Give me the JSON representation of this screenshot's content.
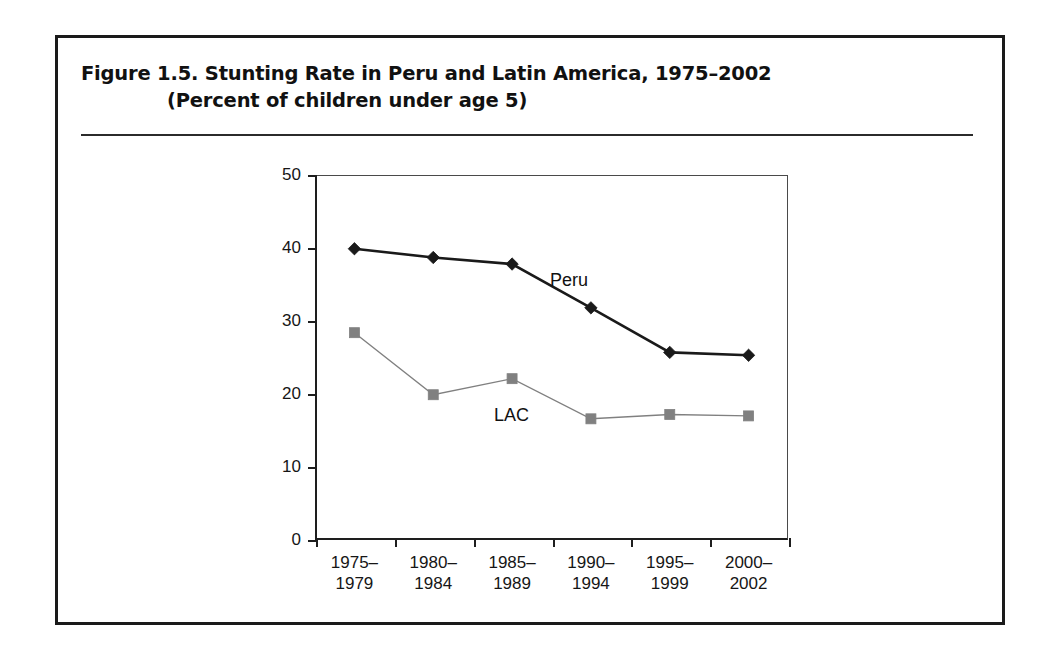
{
  "figure": {
    "title_line_1": "Figure 1.5.  Stunting Rate in Peru and Latin America, 1975–2002",
    "title_line_2": "(Percent of children under age 5)"
  },
  "chart_data": {
    "type": "line",
    "title": "Figure 1.5.  Stunting Rate in Peru and Latin America, 1975–2002",
    "subtitle": "(Percent of children under age 5)",
    "xlabel": "",
    "ylabel": "",
    "ylim": [
      0,
      50
    ],
    "yticks": [
      0,
      10,
      20,
      30,
      40,
      50
    ],
    "ytick_labels": [
      "0",
      "10",
      "20",
      "30",
      "40",
      "50"
    ],
    "grid": false,
    "legend": "inline-annotations",
    "categories": [
      "1975–\n1979",
      "1980–\n1984",
      "1985–\n1989",
      "1990–\n1994",
      "1995–\n1999",
      "2000–\n2002"
    ],
    "category_lines": [
      [
        "1975–",
        "1979"
      ],
      [
        "1980–",
        "1984"
      ],
      [
        "1985–",
        "1989"
      ],
      [
        "1990–",
        "1994"
      ],
      [
        "1995–",
        "1999"
      ],
      [
        "2000–",
        "2002"
      ]
    ],
    "series": [
      {
        "name": "Peru",
        "values": [
          39.9,
          38.7,
          37.8,
          31.8,
          25.7,
          25.3
        ],
        "color": "#1a1a1a",
        "marker": "diamond",
        "line_width": 2.6
      },
      {
        "name": "LAC",
        "values": [
          28.4,
          19.9,
          22.1,
          16.6,
          17.2,
          17.0
        ],
        "color": "#808080",
        "marker": "square",
        "line_width": 1.4
      }
    ],
    "annotations": [
      {
        "text": "Peru",
        "series": "Peru"
      },
      {
        "text": "LAC",
        "series": "LAC"
      }
    ]
  }
}
